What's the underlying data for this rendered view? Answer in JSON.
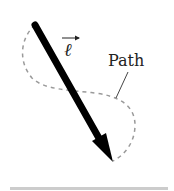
{
  "diagram": {
    "vector_label": "ℓ",
    "path_label": "Path",
    "colors": {
      "vector": "#000000",
      "path": "#999999",
      "leader": "#444444",
      "text": "#222222",
      "bottom_rule": "#cccccc"
    }
  }
}
